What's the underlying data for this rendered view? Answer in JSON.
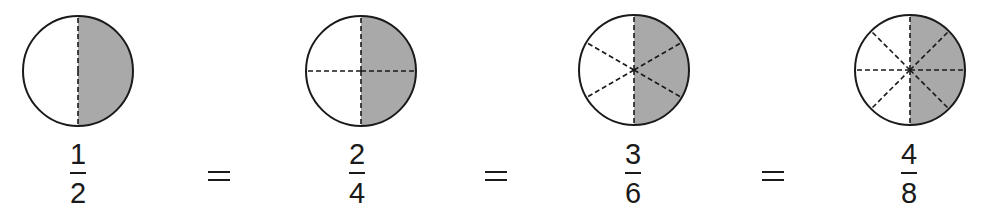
{
  "figure": {
    "colors": {
      "shade": "#a9a9a9",
      "stroke": "#1a1a1a",
      "background": "#ffffff"
    },
    "equals_symbol": "=",
    "items": [
      {
        "numerator": "1",
        "denominator": "2",
        "parts": 2,
        "shaded_parts": 1,
        "cx": 78,
        "cy": 71,
        "r": 55,
        "fraction_x": 58
      },
      {
        "numerator": "2",
        "denominator": "4",
        "parts": 4,
        "shaded_parts": 2,
        "cx": 361,
        "cy": 71,
        "r": 55,
        "fraction_x": 337
      },
      {
        "numerator": "3",
        "denominator": "6",
        "parts": 6,
        "shaded_parts": 3,
        "cx": 634,
        "cy": 70,
        "r": 55,
        "fraction_x": 613
      },
      {
        "numerator": "4",
        "denominator": "8",
        "parts": 8,
        "shaded_parts": 4,
        "cx": 910,
        "cy": 70,
        "r": 55,
        "fraction_x": 889
      }
    ],
    "equals_positions": [
      {
        "x": 208,
        "y": 171
      },
      {
        "x": 485,
        "y": 171
      },
      {
        "x": 762,
        "y": 171
      }
    ]
  }
}
